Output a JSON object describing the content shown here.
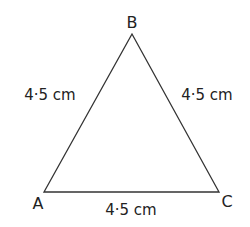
{
  "diagram": {
    "vertices": {
      "A": "A",
      "B": "B",
      "C": "C"
    },
    "sides": {
      "AB": "4·5 cm",
      "BC": "4·5 cm",
      "AC": "4·5 cm"
    },
    "line_color": "#333333"
  }
}
